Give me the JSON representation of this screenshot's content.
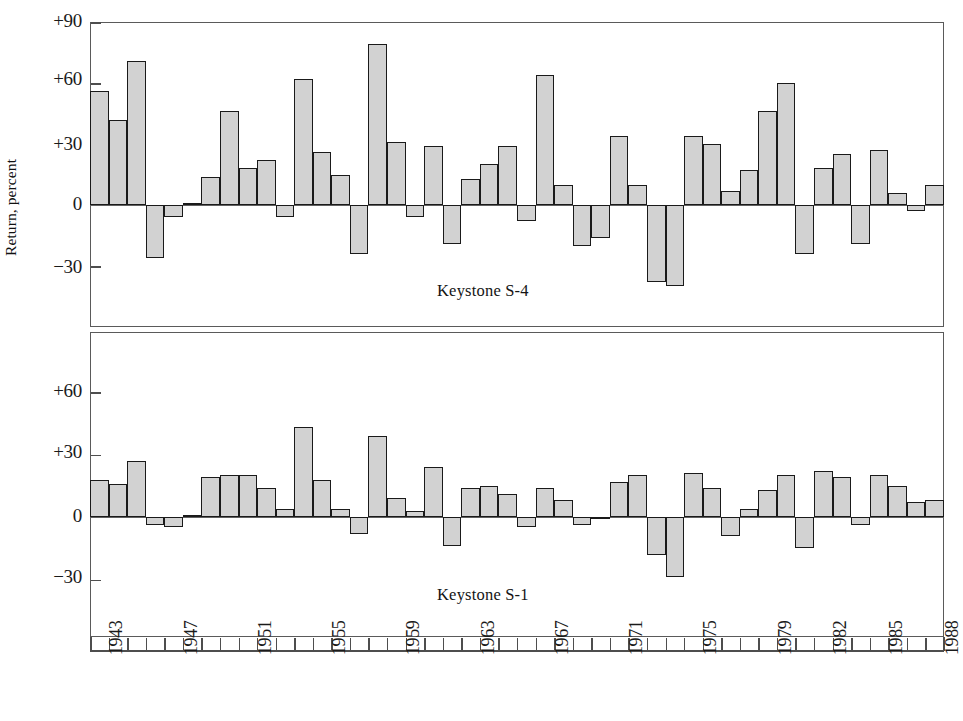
{
  "figure": {
    "ylabel": "Return, percent",
    "panels": [
      {
        "caption": "Keystone S-4"
      },
      {
        "caption": "Keystone S-1"
      }
    ],
    "y_tick_labels_top": [
      "+90",
      "+60",
      "+30",
      "0",
      "-30"
    ],
    "y_tick_labels_bottom": [
      "+60",
      "+30",
      "0",
      "-30"
    ],
    "x_tick_labels": [
      "1943",
      "1947",
      "1951",
      "1955",
      "1959",
      "1963",
      "1967",
      "1971",
      "1975",
      "1979",
      "1982",
      "1985",
      "1988"
    ],
    "colors": {
      "bar_fill": "#d2d2d2",
      "bar_edge": "#1a1a1a",
      "frame": "#5a5a5a",
      "text": "#1a1a1a"
    }
  },
  "chart_data": [
    {
      "type": "bar",
      "title": "Keystone S-4",
      "xlabel": "",
      "ylabel": "Return, percent",
      "ylim": [
        -45,
        90
      ],
      "yticks": [
        -30,
        0,
        30,
        60,
        90
      ],
      "grid": false,
      "legend": "none",
      "categories": [
        1943,
        1944,
        1945,
        1946,
        1947,
        1948,
        1949,
        1950,
        1951,
        1952,
        1953,
        1954,
        1955,
        1956,
        1957,
        1958,
        1959,
        1960,
        1961,
        1962,
        1963,
        1964,
        1965,
        1966,
        1967,
        1968,
        1969,
        1970,
        1971,
        1972,
        1973,
        1974,
        1975,
        1976,
        1977,
        1978,
        1979,
        1980,
        1981,
        1982,
        1983,
        1984,
        1985,
        1986,
        1987,
        1988
      ],
      "values": [
        56,
        42,
        71,
        -26,
        -6,
        1,
        14,
        46,
        18,
        22,
        -6,
        62,
        26,
        15,
        -24,
        79,
        31,
        -6,
        29,
        -19,
        13,
        20,
        29,
        -8,
        64,
        10,
        -20,
        -16,
        34,
        10,
        -38,
        -40,
        34,
        30,
        7,
        17,
        46,
        60,
        -24,
        18,
        25,
        -19,
        27,
        6,
        -3,
        10
      ]
    },
    {
      "type": "bar",
      "title": "Keystone S-1",
      "xlabel": "",
      "ylabel": "Return, percent",
      "ylim": [
        -45,
        75
      ],
      "yticks": [
        -30,
        0,
        30,
        60
      ],
      "grid": false,
      "legend": "none",
      "categories": [
        1943,
        1944,
        1945,
        1946,
        1947,
        1948,
        1949,
        1950,
        1951,
        1952,
        1953,
        1954,
        1955,
        1956,
        1957,
        1958,
        1959,
        1960,
        1961,
        1962,
        1963,
        1964,
        1965,
        1966,
        1967,
        1968,
        1969,
        1970,
        1971,
        1972,
        1973,
        1974,
        1975,
        1976,
        1977,
        1978,
        1979,
        1980,
        1981,
        1982,
        1983,
        1984,
        1985,
        1986,
        1987,
        1988
      ],
      "values": [
        18,
        16,
        27,
        -4,
        -5,
        1,
        19,
        20,
        20,
        14,
        4,
        43,
        18,
        4,
        -8,
        39,
        9,
        3,
        24,
        -14,
        14,
        15,
        11,
        -5,
        14,
        8,
        -4,
        -1,
        17,
        20,
        -18,
        -29,
        21,
        14,
        -9,
        4,
        13,
        20,
        -15,
        22,
        19,
        -4,
        20,
        15,
        7,
        8
      ]
    }
  ]
}
